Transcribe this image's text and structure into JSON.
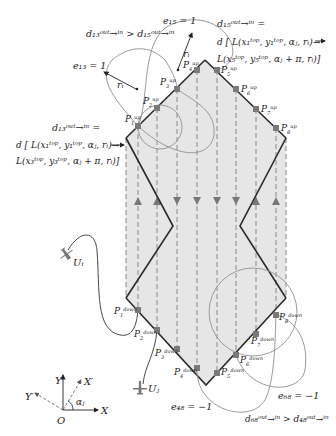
{
  "diagram": {
    "type": "uav-coverage-path-planning",
    "region": {
      "fill": "#e6e6e6",
      "outline_color": "#2a2a2a",
      "vertices": [
        [
          205,
          60
        ],
        [
          286,
          138
        ],
        [
          240,
          226
        ],
        [
          286,
          298
        ],
        [
          206,
          385
        ],
        [
          126,
          298
        ],
        [
          173,
          226
        ],
        [
          126,
          138
        ]
      ]
    },
    "sweep_lines": {
      "color": "#8a8a8a",
      "x": [
        126,
        138,
        157,
        177,
        197,
        217,
        236,
        256,
        276,
        286
      ],
      "arrow_directions": [
        "up",
        "up",
        "up",
        "down",
        "down",
        "down",
        "down",
        "up",
        "up",
        "up"
      ]
    },
    "points_top": [
      {
        "id": "P1",
        "label": "P",
        "sub": "1",
        "sup": "up",
        "x": 138,
        "y": 126
      },
      {
        "id": "P2",
        "label": "P",
        "sub": "2",
        "sup": "up",
        "x": 157,
        "y": 108
      },
      {
        "id": "P3",
        "label": "P",
        "sub": "3",
        "sup": "up",
        "x": 177,
        "y": 89
      },
      {
        "id": "P4",
        "label": "P",
        "sub": "4",
        "sup": "up",
        "x": 197,
        "y": 70
      },
      {
        "id": "P5",
        "label": "P",
        "sub": "5",
        "sup": "up",
        "x": 217,
        "y": 70
      },
      {
        "id": "P6",
        "label": "P",
        "sub": "6",
        "sup": "up",
        "x": 236,
        "y": 89
      },
      {
        "id": "P7",
        "label": "P",
        "sub": "7",
        "sup": "up",
        "x": 256,
        "y": 109
      },
      {
        "id": "P8",
        "label": "P",
        "sub": "8",
        "sup": "up",
        "x": 276,
        "y": 128
      }
    ],
    "points_bottom": [
      {
        "id": "P1d",
        "label": "P",
        "sub": "1",
        "sup": "down",
        "x": 138,
        "y": 310
      },
      {
        "id": "P2d",
        "label": "P",
        "sub": "2",
        "sup": "down",
        "x": 157,
        "y": 330
      },
      {
        "id": "P3d",
        "label": "P",
        "sub": "3",
        "sup": "down",
        "x": 177,
        "y": 349
      },
      {
        "id": "P4d",
        "label": "P",
        "sub": "4",
        "sup": "down",
        "x": 197,
        "y": 368
      },
      {
        "id": "P5d",
        "label": "P",
        "sub": "5",
        "sup": "down",
        "x": 217,
        "y": 373
      },
      {
        "id": "P6d",
        "label": "P",
        "sub": "6",
        "sup": "down",
        "x": 236,
        "y": 355
      },
      {
        "id": "P7d",
        "label": "P",
        "sub": "7",
        "sup": "down",
        "x": 256,
        "y": 334
      },
      {
        "id": "P8d",
        "label": "P",
        "sub": "8",
        "sup": "down",
        "x": 276,
        "y": 315
      }
    ],
    "annotations": {
      "d13_compare": "d₁₃ᵒᵘᵗ→ⁱⁿ > d₁₅ᵒᵘᵗ→ⁱⁿ",
      "e13": "e₁₃ = 1",
      "e15": "e₁₅ = 1",
      "ri": "rᵢ",
      "d15_title": "d₁₅ᵒᵘᵗ→ⁱⁿ =",
      "d15_line1": "d [ L(x₁ᵗᵒᵖ, y₁ᵗᵒᵖ, αⱼ, rᵢ)→",
      "d15_line2": "L(x₅ᵗᵒᵖ, y₅ᵗᵒᵖ, αⱼ + π, rᵢ)]",
      "d13_title": "d₁₃ᵒᵘᵗ→ⁱⁿ =",
      "d13_line1": "d [ L(x₁ᵗᵒᵖ, y₁ᵗᵒᵖ, αⱼ, rᵢ)→",
      "d13_line2": "L(x₃ᵗᵒᵖ, y₃ᵗᵒᵖ, αⱼ + π, rᵢ)]",
      "e48": "e₄₈ = −1",
      "e68": "e₆₈ = −1",
      "d68_compare": "d₆₈ᵒᵘᵗ→ⁱⁿ > d₄₈ᵒᵘᵗ→ⁱⁿ"
    },
    "uavs": [
      {
        "label": "Uᵢ",
        "x": 63,
        "y": 257
      },
      {
        "label": "Uⱼ",
        "x": 140,
        "y": 389
      }
    ],
    "axes": {
      "origin_label": "O",
      "x_label": "X",
      "y_label": "Y",
      "x_prime_label": "X′",
      "y_prime_label": "Y′",
      "angle_label": "αⱼ"
    },
    "curve_color": "#9a9a9a",
    "point_color": "#7a7a7a"
  }
}
